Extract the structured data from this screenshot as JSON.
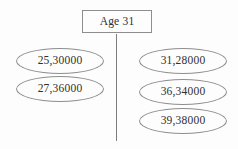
{
  "diagram": {
    "type": "tree",
    "root": {
      "label": "Age 31",
      "shape": "rectangle"
    },
    "branches": [
      {
        "side": "left",
        "nodes": [
          {
            "label": "25,30000",
            "shape": "ellipse"
          },
          {
            "label": "27,36000",
            "shape": "ellipse"
          }
        ]
      },
      {
        "side": "right",
        "nodes": [
          {
            "label": "31,28000",
            "shape": "ellipse"
          },
          {
            "label": "36,34000",
            "shape": "ellipse"
          },
          {
            "label": "39,38000",
            "shape": "ellipse"
          }
        ]
      }
    ],
    "colors": {
      "background": "#fdfdfd",
      "stroke": "#8e8e8e",
      "text": "#303030",
      "connector": "#7d7d7d"
    }
  }
}
